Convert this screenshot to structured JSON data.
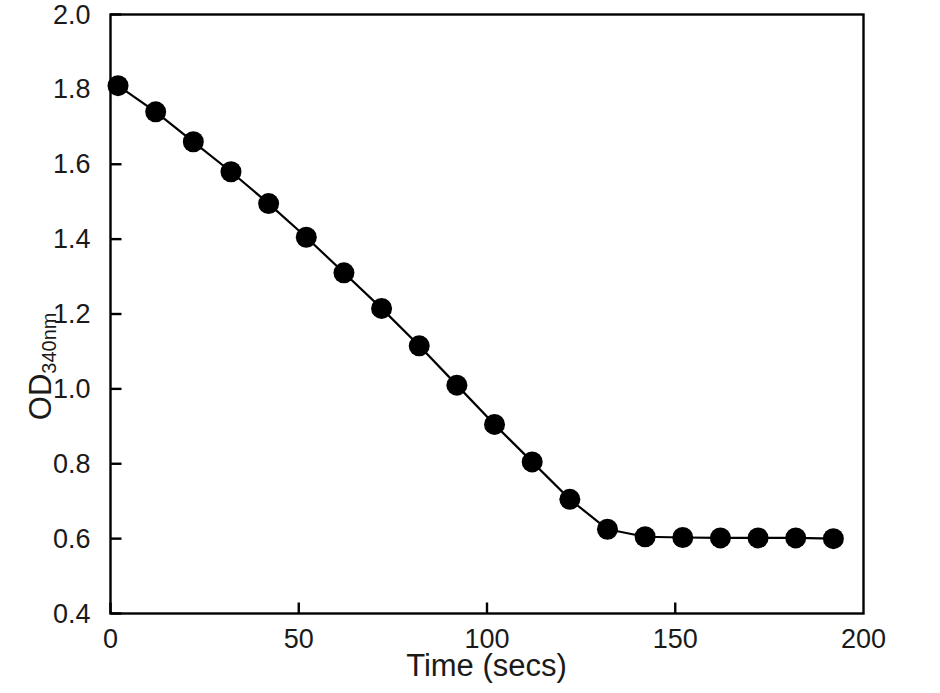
{
  "chart_data": {
    "type": "line",
    "title": "",
    "subtitle": "",
    "xlabel": "Time (secs)",
    "ylabel": "OD",
    "ylabel_sub": "340nm",
    "ylabel_full": "OD340nm",
    "xlim": [
      0,
      200
    ],
    "ylim": [
      0.4,
      2.0
    ],
    "xticks": [
      0,
      50,
      100,
      150,
      200
    ],
    "xtick_labels": [
      "0",
      "50",
      "100",
      "150",
      "200"
    ],
    "yticks": [
      0.4,
      0.6,
      0.8,
      1.0,
      1.2,
      1.4,
      1.6,
      1.8,
      2.0
    ],
    "ytick_labels": [
      "0.4",
      "0.6",
      "0.8",
      "1.0",
      "1.2",
      "1.4",
      "1.6",
      "1.8",
      "2.0"
    ],
    "grid": false,
    "legend": false,
    "legend_position": "none",
    "marker": "filled-circle",
    "marker_color": "#000000",
    "line_color": "#000000",
    "series": [
      {
        "name": "OD340nm",
        "x": [
          2,
          12,
          22,
          32,
          42,
          52,
          62,
          72,
          82,
          92,
          102,
          112,
          122,
          132,
          142,
          152,
          162,
          172,
          182,
          192
        ],
        "values": [
          1.81,
          1.74,
          1.66,
          1.58,
          1.495,
          1.405,
          1.31,
          1.215,
          1.115,
          1.01,
          0.905,
          0.805,
          0.705,
          0.625,
          0.605,
          0.603,
          0.602,
          0.602,
          0.602,
          0.6
        ]
      }
    ]
  },
  "axes": {
    "frame_color": "#000000",
    "tick_color": "#000000"
  }
}
